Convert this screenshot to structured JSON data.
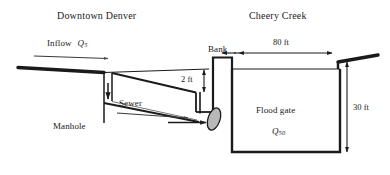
{
  "figure": {
    "type": "engineering-cross-section",
    "background_color": "#ffffff",
    "line_color": "#1a1a1a",
    "gate_fill": "#b0b0b0"
  },
  "labels": {
    "left_region": "Downtown Denver",
    "right_region": "Cheery Creek",
    "inflow": "Inflow",
    "inflow_symbol": "Q",
    "inflow_subscript": "5",
    "manhole": "Manhole",
    "sewer": "Sewer",
    "bank": "Bank",
    "flood_gate": "Flood gate",
    "outflow_symbol": "Q",
    "outflow_subscript": "50"
  },
  "dimensions": [
    {
      "name": "sewer-drop",
      "value": "2 ft",
      "orientation": "vertical"
    },
    {
      "name": "creek-width",
      "value": "80 ft",
      "orientation": "horizontal"
    },
    {
      "name": "creek-depth",
      "value": "30 ft",
      "orientation": "vertical"
    }
  ],
  "flow_arrows": [
    {
      "name": "inflow-arrow",
      "direction": "right"
    },
    {
      "name": "manhole-down-arrow",
      "direction": "down"
    },
    {
      "name": "sewer-flow-arrow",
      "direction": "right"
    },
    {
      "name": "gate-outflow-arrow",
      "direction": "right"
    }
  ]
}
